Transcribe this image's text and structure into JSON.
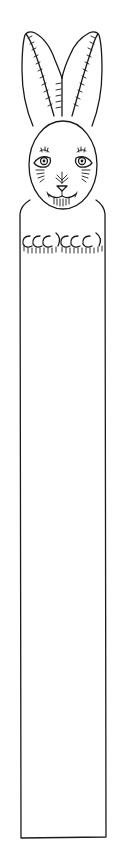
{
  "artwork": {
    "subject": "rabbit bookmark coloring outline",
    "parts": [
      "left-ear",
      "right-ear",
      "head",
      "eyes",
      "nose",
      "mouth",
      "whiskers",
      "body-panel",
      "paws"
    ],
    "line_color": "#1a1a1a",
    "background_color": "#ffffff"
  }
}
